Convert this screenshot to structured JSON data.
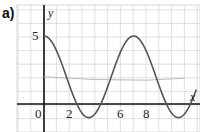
{
  "panel_label": "a)",
  "chart_data": {
    "type": "line",
    "title": "",
    "xlabel": "x",
    "ylabel": "y",
    "x_tick_labels": [
      "0",
      "2",
      "6",
      "8"
    ],
    "y_tick_labels": [
      "5"
    ],
    "xlim": [
      -2,
      12
    ],
    "ylim": [
      -2,
      7
    ],
    "grid": true,
    "legend": null,
    "series": [
      {
        "name": "curve",
        "formula": "y = 2 + 3cos(2πx/7)",
        "x": [
          0,
          1,
          2,
          2.56,
          3,
          3.5,
          4,
          4.44,
          5,
          6,
          7,
          8,
          9,
          9.56,
          10,
          10.5,
          11,
          11.44,
          11.8
        ],
        "y": [
          5,
          3.87,
          1.33,
          0,
          -0.7,
          -1,
          -0.7,
          0,
          1.33,
          3.87,
          5,
          3.87,
          1.33,
          0,
          -0.7,
          -1,
          -0.7,
          0,
          0.5
        ]
      },
      {
        "name": "midline (faint, hand-drawn)",
        "x": [
          0,
          4,
          8,
          11
        ],
        "y": [
          2,
          1.8,
          1.75,
          1.9
        ]
      }
    ],
    "annotations": [
      "y-intercept labeled 5",
      "axis labels y and x"
    ]
  },
  "colors": {
    "curve": "#555555",
    "axis": "#111111",
    "grid": "#d8d8d8",
    "midline": "#b8bcbc"
  }
}
